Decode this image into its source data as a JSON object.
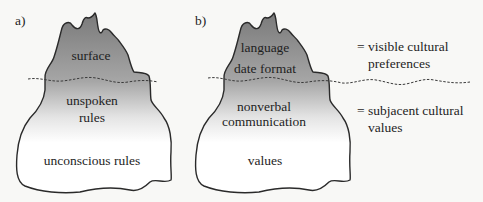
{
  "figure": {
    "panels": [
      {
        "tag": "a)",
        "above_water": [
          "surface"
        ],
        "below_water_upper": [
          "unspoken",
          "rules"
        ],
        "below_water_lower": [
          "unconscious rules"
        ]
      },
      {
        "tag": "b)",
        "above_water": [
          "language",
          "date format"
        ],
        "below_water_upper": [
          "nonverbal",
          "communication"
        ],
        "below_water_lower": [
          "values"
        ]
      }
    ],
    "legend": [
      {
        "symbol": "=",
        "lines": [
          "visible cultural",
          "preferences"
        ]
      },
      {
        "symbol": "=",
        "lines": [
          "subjacent cultural",
          "values"
        ]
      }
    ],
    "colors": {
      "tip_top": "#7d7d7d",
      "tip_bottom": "#a9a9a9",
      "fade_end": "#ffffff",
      "outline": "#2a2a2a",
      "background": "#f8f8f6"
    }
  }
}
